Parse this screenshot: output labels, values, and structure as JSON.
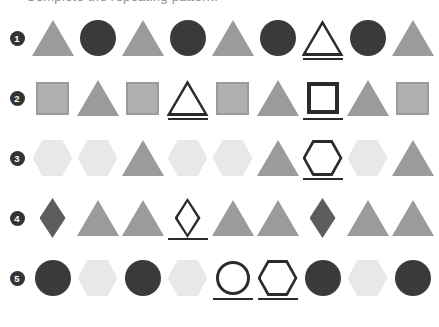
{
  "heading": "Complete the repeating pattern.",
  "palette": {
    "triangle_fill": "#9b9b9b",
    "circle_fill": "#3a3a3a",
    "hexagon_fill": "#e8e8e8",
    "diamond_fill": "#5d5d5d",
    "square_fill": "#b0b0b0",
    "square_border": "#9a9a9a",
    "outline_stroke": "#2b2b2b",
    "badge_background": "#333333",
    "badge_text": "#ffffff",
    "page_background": "#ffffff"
  },
  "rows": [
    {
      "number": "1",
      "shapes": [
        {
          "shape": "triangle",
          "state": "filled"
        },
        {
          "shape": "circle",
          "state": "filled"
        },
        {
          "shape": "triangle",
          "state": "filled"
        },
        {
          "shape": "circle",
          "state": "filled"
        },
        {
          "shape": "triangle",
          "state": "filled"
        },
        {
          "shape": "circle",
          "state": "filled"
        },
        {
          "shape": "triangle",
          "state": "answer"
        },
        {
          "shape": "circle",
          "state": "filled"
        },
        {
          "shape": "triangle",
          "state": "filled"
        }
      ]
    },
    {
      "number": "2",
      "shapes": [
        {
          "shape": "square",
          "state": "filled"
        },
        {
          "shape": "triangle",
          "state": "filled"
        },
        {
          "shape": "square",
          "state": "filled"
        },
        {
          "shape": "triangle",
          "state": "answer"
        },
        {
          "shape": "square",
          "state": "filled"
        },
        {
          "shape": "triangle",
          "state": "filled"
        },
        {
          "shape": "square",
          "state": "answer"
        },
        {
          "shape": "triangle",
          "state": "filled"
        },
        {
          "shape": "square",
          "state": "filled"
        }
      ]
    },
    {
      "number": "3",
      "shapes": [
        {
          "shape": "hexagon",
          "state": "filled"
        },
        {
          "shape": "hexagon",
          "state": "filled"
        },
        {
          "shape": "triangle",
          "state": "filled"
        },
        {
          "shape": "hexagon",
          "state": "filled"
        },
        {
          "shape": "hexagon",
          "state": "filled"
        },
        {
          "shape": "triangle",
          "state": "filled"
        },
        {
          "shape": "hexagon",
          "state": "answer"
        },
        {
          "shape": "hexagon",
          "state": "filled"
        },
        {
          "shape": "triangle",
          "state": "filled"
        }
      ]
    },
    {
      "number": "4",
      "shapes": [
        {
          "shape": "diamond",
          "state": "filled"
        },
        {
          "shape": "triangle",
          "state": "filled"
        },
        {
          "shape": "triangle",
          "state": "filled"
        },
        {
          "shape": "diamond",
          "state": "answer"
        },
        {
          "shape": "triangle",
          "state": "filled"
        },
        {
          "shape": "triangle",
          "state": "filled"
        },
        {
          "shape": "diamond",
          "state": "filled"
        },
        {
          "shape": "triangle",
          "state": "filled"
        },
        {
          "shape": "triangle",
          "state": "filled"
        }
      ]
    },
    {
      "number": "5",
      "shapes": [
        {
          "shape": "circle",
          "state": "filled"
        },
        {
          "shape": "hexagon",
          "state": "filled"
        },
        {
          "shape": "circle",
          "state": "filled"
        },
        {
          "shape": "hexagon",
          "state": "filled"
        },
        {
          "shape": "circle",
          "state": "answer"
        },
        {
          "shape": "hexagon",
          "state": "answer"
        },
        {
          "shape": "circle",
          "state": "filled"
        },
        {
          "shape": "hexagon",
          "state": "filled"
        },
        {
          "shape": "circle",
          "state": "filled"
        }
      ]
    }
  ]
}
